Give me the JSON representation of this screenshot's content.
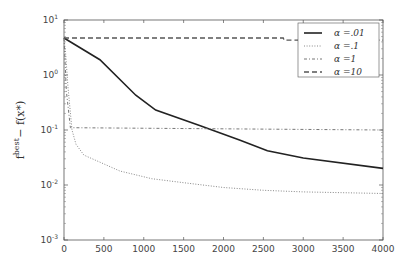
{
  "chart_data": {
    "type": "line",
    "title": "",
    "xlabel": "",
    "ylabel": "f_k^best − f(x*)",
    "yscale": "log",
    "xlim": [
      0,
      4000
    ],
    "ylim": [
      0.001,
      10
    ],
    "grid": false,
    "legend_position": "upper right",
    "x_ticks": [
      "0",
      "500",
      "1000",
      "1500",
      "2000",
      "2500",
      "3000",
      "3500",
      "4000"
    ],
    "y_ticks": [
      {
        "base": "10",
        "exp": "1",
        "value": 10
      },
      {
        "base": "10",
        "exp": "0",
        "value": 1
      },
      {
        "base": "10",
        "exp": "-1",
        "value": 0.1
      },
      {
        "base": "10",
        "exp": "-2",
        "value": 0.01
      },
      {
        "base": "10",
        "exp": "-3",
        "value": 0.001
      }
    ],
    "series": [
      {
        "name": "α=.01",
        "style": "solid",
        "color": "#222222",
        "x": [
          0,
          450,
          900,
          1150,
          1700,
          2200,
          2550,
          3000,
          4000
        ],
        "values": [
          4.7,
          1.9,
          0.43,
          0.23,
          0.12,
          0.066,
          0.042,
          0.031,
          0.02
        ]
      },
      {
        "name": "α=.1",
        "style": "dotted",
        "color": "#888888",
        "x": [
          0,
          20,
          50,
          100,
          150,
          250,
          400,
          700,
          1100,
          1500,
          2000,
          2500,
          3000,
          4000
        ],
        "values": [
          4.7,
          2.5,
          0.6,
          0.1,
          0.055,
          0.035,
          0.028,
          0.018,
          0.013,
          0.011,
          0.009,
          0.008,
          0.0075,
          0.007
        ]
      },
      {
        "name": "α=1",
        "style": "dashdot",
        "color": "#777777",
        "x": [
          0,
          30,
          80,
          4000
        ],
        "values": [
          4.7,
          0.5,
          0.11,
          0.1
        ]
      },
      {
        "name": "α=10",
        "style": "dashed",
        "color": "#555555",
        "x": [
          0,
          2750,
          2760,
          4000
        ],
        "values": [
          4.7,
          4.7,
          4.3,
          4.3
        ]
      }
    ]
  },
  "legend": {
    "entries": [
      "α =.01",
      "α =.1",
      "α =1",
      "α =10"
    ]
  },
  "axis": {
    "ylabel_main": "f",
    "ylabel_sup": "best",
    "ylabel_sub": "k",
    "ylabel_rest": " − f(x*)"
  }
}
